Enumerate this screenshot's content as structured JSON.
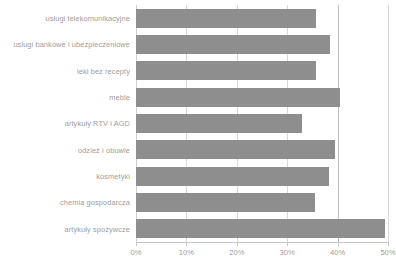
{
  "chart_data": {
    "type": "bar",
    "orientation": "horizontal",
    "title": "",
    "subtitle": "",
    "xlabel": "",
    "ylabel": "",
    "xlim": [
      0,
      50
    ],
    "grid": true,
    "legend": null,
    "bar_color": "#8e8e8e",
    "grid_color": "#d9d9d9",
    "tick_labels": [
      "0%",
      "10%",
      "20%",
      "30%",
      "40%",
      "50%"
    ],
    "tick_values": [
      0,
      10,
      20,
      30,
      40,
      50
    ],
    "categories": [
      "usługi telekomunikacyjne",
      "usługi bankowe i ubezpieczeniowe",
      "leki bez recepty",
      "meble",
      "artykuły RTV i AGD",
      "odzież i obuwie",
      "kosmetyki",
      "chemia gospodarcza",
      "artykuły spożywcze"
    ],
    "values": [
      35.7,
      38.5,
      35.8,
      40.5,
      33.0,
      39.4,
      38.2,
      35.5,
      49.5
    ]
  }
}
